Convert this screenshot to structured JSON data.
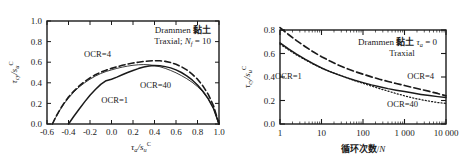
{
  "figure": {
    "background": "#ffffff",
    "panels": [
      "left",
      "right"
    ]
  },
  "chart_data": [
    {
      "id": "left",
      "type": "line",
      "title": "",
      "annotation_lines": [
        "Drammen 黏土",
        "Traxial;  N_f = 10"
      ],
      "annotation_material": "Drammen",
      "annotation_soil_cjk": "黏土",
      "annotation_test": "Traxial;",
      "annotation_nf_symbol": "N",
      "annotation_nf_sub": "f",
      "annotation_nf_value": "= 10",
      "xlabel_main": "τ",
      "xlabel_sub": "a",
      "xlabel_denom": "/s",
      "xlabel_denom_sub": "u",
      "xlabel_sup": "C",
      "ylabel_main": "τ",
      "ylabel_sub": "cy",
      "ylabel_denom": "/s",
      "ylabel_denom_sub": "u",
      "ylabel_sup": "C",
      "xlim": [
        -0.6,
        1.0
      ],
      "ylim": [
        0.0,
        1.0
      ],
      "xticks": [
        -0.6,
        -0.4,
        -0.2,
        0.0,
        0.2,
        0.4,
        0.6,
        0.8,
        1.0
      ],
      "xtick_labels": [
        "-0.6",
        "-0.4",
        "-0.2",
        "0.0",
        "0.2",
        "0.4",
        "0.6",
        "0.8",
        "1.0"
      ],
      "yticks": [
        0.0,
        0.2,
        0.4,
        0.6,
        0.8,
        1.0
      ],
      "ytick_labels": [
        "0.0",
        "0.2",
        "0.4",
        "0.6",
        "0.8",
        "1.0"
      ],
      "grid": false,
      "legend_position": "inline-annotations",
      "series": [
        {
          "name": "OCR=1",
          "style": "solid",
          "label": "OCR=1",
          "label_x": 0.03,
          "label_y": 0.205,
          "points": [
            [
              -0.4,
              0.0
            ],
            [
              -0.35,
              0.075
            ],
            [
              -0.3,
              0.145
            ],
            [
              -0.25,
              0.215
            ],
            [
              -0.2,
              0.28
            ],
            [
              -0.15,
              0.335
            ],
            [
              -0.1,
              0.385
            ],
            [
              -0.05,
              0.42
            ],
            [
              0.0,
              0.435
            ],
            [
              0.05,
              0.455
            ],
            [
              0.1,
              0.478
            ],
            [
              0.15,
              0.5
            ],
            [
              0.2,
              0.52
            ],
            [
              0.25,
              0.538
            ],
            [
              0.3,
              0.553
            ],
            [
              0.35,
              0.563
            ],
            [
              0.4,
              0.568
            ],
            [
              0.45,
              0.565
            ],
            [
              0.5,
              0.557
            ],
            [
              0.55,
              0.545
            ],
            [
              0.6,
              0.525
            ],
            [
              0.65,
              0.5
            ],
            [
              0.7,
              0.468
            ],
            [
              0.75,
              0.428
            ],
            [
              0.8,
              0.378
            ],
            [
              0.85,
              0.318
            ],
            [
              0.9,
              0.245
            ],
            [
              0.95,
              0.148
            ],
            [
              1.0,
              0.0
            ]
          ]
        },
        {
          "name": "OCR=4",
          "style": "dashed",
          "label": "OCR=4",
          "label_x": -0.13,
          "label_y": 0.655,
          "points": [
            [
              -0.55,
              0.0
            ],
            [
              -0.52,
              0.065
            ],
            [
              -0.48,
              0.14
            ],
            [
              -0.44,
              0.205
            ],
            [
              -0.4,
              0.262
            ],
            [
              -0.35,
              0.32
            ],
            [
              -0.3,
              0.37
            ],
            [
              -0.25,
              0.412
            ],
            [
              -0.2,
              0.448
            ],
            [
              -0.15,
              0.478
            ],
            [
              -0.1,
              0.503
            ],
            [
              -0.05,
              0.523
            ],
            [
              0.0,
              0.54
            ],
            [
              0.05,
              0.555
            ],
            [
              0.1,
              0.57
            ],
            [
              0.15,
              0.582
            ],
            [
              0.2,
              0.592
            ],
            [
              0.25,
              0.6
            ],
            [
              0.3,
              0.607
            ],
            [
              0.35,
              0.612
            ],
            [
              0.4,
              0.615
            ],
            [
              0.45,
              0.614
            ],
            [
              0.5,
              0.608
            ],
            [
              0.55,
              0.597
            ],
            [
              0.6,
              0.58
            ],
            [
              0.65,
              0.556
            ],
            [
              0.7,
              0.525
            ],
            [
              0.75,
              0.485
            ],
            [
              0.8,
              0.435
            ],
            [
              0.85,
              0.37
            ],
            [
              0.9,
              0.288
            ],
            [
              0.95,
              0.175
            ],
            [
              1.0,
              0.0
            ]
          ]
        },
        {
          "name": "OCR=40",
          "style": "thin-solid",
          "label": "OCR=40",
          "label_x": 0.41,
          "label_y": 0.345,
          "points": [
            [
              -0.55,
              0.0
            ],
            [
              -0.52,
              0.062
            ],
            [
              -0.48,
              0.135
            ],
            [
              -0.44,
              0.198
            ],
            [
              -0.4,
              0.252
            ],
            [
              -0.35,
              0.31
            ],
            [
              -0.3,
              0.36
            ],
            [
              -0.25,
              0.4
            ],
            [
              -0.2,
              0.435
            ],
            [
              -0.15,
              0.465
            ],
            [
              -0.1,
              0.49
            ],
            [
              -0.05,
              0.51
            ],
            [
              0.0,
              0.525
            ],
            [
              0.05,
              0.54
            ],
            [
              0.1,
              0.552
            ],
            [
              0.15,
              0.562
            ],
            [
              0.2,
              0.57
            ],
            [
              0.25,
              0.575
            ],
            [
              0.3,
              0.577
            ],
            [
              0.35,
              0.575
            ],
            [
              0.4,
              0.568
            ],
            [
              0.45,
              0.556
            ],
            [
              0.5,
              0.54
            ],
            [
              0.55,
              0.52
            ],
            [
              0.6,
              0.497
            ],
            [
              0.65,
              0.47
            ],
            [
              0.7,
              0.44
            ],
            [
              0.75,
              0.405
            ],
            [
              0.8,
              0.363
            ],
            [
              0.85,
              0.312
            ],
            [
              0.9,
              0.245
            ],
            [
              0.95,
              0.15
            ],
            [
              1.0,
              0.0
            ]
          ]
        }
      ]
    },
    {
      "id": "right",
      "type": "line",
      "title": "",
      "annotation_lines": [
        "Drammen 黏土 τ_a = 0",
        "Traxial"
      ],
      "annotation_material": "Drammen",
      "annotation_soil_cjk": "黏土",
      "annotation_tau_symbol": "τ",
      "annotation_tau_sub": "a",
      "annotation_tau_value": "= 0",
      "annotation_test": "Traxial",
      "xlabel_cjk": "循环次数",
      "xlabel_slash": "/",
      "xlabel_n": "N",
      "ylabel_main": "τ",
      "ylabel_sub": "cy",
      "ylabel_denom": "/s",
      "ylabel_denom_sub": "u",
      "ylabel_sup": "C",
      "xscale": "log",
      "xlim": [
        1,
        10000
      ],
      "ylim": [
        0.0,
        0.8
      ],
      "xticks": [
        1,
        10,
        100,
        1000,
        10000
      ],
      "xtick_labels": [
        "1",
        "10",
        "100",
        "1 000",
        "10 000"
      ],
      "yticks": [
        0.0,
        0.2,
        0.4,
        0.6,
        0.8
      ],
      "ytick_labels": [
        "0.0",
        "0.2",
        "0.4",
        "0.6",
        "0.8"
      ],
      "grid": false,
      "legend_position": "inline-annotations",
      "series": [
        {
          "name": "OCR=1",
          "style": "solid",
          "label": "OCR=1",
          "label_x_log": 1.6,
          "label_y": 0.385,
          "points": [
            [
              1,
              0.69
            ],
            [
              1.6,
              0.64
            ],
            [
              2.5,
              0.595
            ],
            [
              4,
              0.552
            ],
            [
              6.3,
              0.513
            ],
            [
              10,
              0.477
            ],
            [
              16,
              0.446
            ],
            [
              25,
              0.42
            ],
            [
              40,
              0.395
            ],
            [
              63,
              0.372
            ],
            [
              100,
              0.352
            ],
            [
              160,
              0.333
            ],
            [
              250,
              0.317
            ],
            [
              400,
              0.301
            ],
            [
              630,
              0.288
            ],
            [
              1000,
              0.276
            ],
            [
              1600,
              0.263
            ],
            [
              2500,
              0.252
            ],
            [
              4000,
              0.242
            ],
            [
              6300,
              0.233
            ],
            [
              10000,
              0.225
            ]
          ]
        },
        {
          "name": "OCR=4",
          "style": "dashed",
          "label": "OCR=4",
          "label_x_log": 2450,
          "label_y": 0.385,
          "points": [
            [
              1,
              0.82
            ],
            [
              1.6,
              0.762
            ],
            [
              2.5,
              0.71
            ],
            [
              4,
              0.66
            ],
            [
              6.3,
              0.614
            ],
            [
              10,
              0.573
            ],
            [
              16,
              0.536
            ],
            [
              25,
              0.503
            ],
            [
              40,
              0.473
            ],
            [
              63,
              0.447
            ],
            [
              100,
              0.424
            ],
            [
              160,
              0.401
            ],
            [
              250,
              0.381
            ],
            [
              400,
              0.362
            ],
            [
              630,
              0.345
            ],
            [
              1000,
              0.328
            ],
            [
              1600,
              0.31
            ],
            [
              2500,
              0.294
            ],
            [
              4000,
              0.277
            ],
            [
              6300,
              0.26
            ],
            [
              10000,
              0.24
            ]
          ]
        },
        {
          "name": "OCR=40",
          "style": "dotted",
          "label": "OCR=40",
          "label_x_log": 900,
          "label_y": 0.145,
          "points": [
            [
              1,
              0.68
            ],
            [
              1.6,
              0.632
            ],
            [
              2.5,
              0.588
            ],
            [
              4,
              0.547
            ],
            [
              6.3,
              0.51
            ],
            [
              10,
              0.476
            ],
            [
              16,
              0.446
            ],
            [
              25,
              0.42
            ],
            [
              40,
              0.394
            ],
            [
              63,
              0.369
            ],
            [
              100,
              0.346
            ],
            [
              160,
              0.323
            ],
            [
              250,
              0.301
            ],
            [
              400,
              0.28
            ],
            [
              630,
              0.259
            ],
            [
              1000,
              0.24
            ],
            [
              1600,
              0.222
            ],
            [
              2500,
              0.207
            ],
            [
              4000,
              0.194
            ],
            [
              6300,
              0.183
            ],
            [
              10000,
              0.175
            ]
          ]
        }
      ]
    }
  ]
}
